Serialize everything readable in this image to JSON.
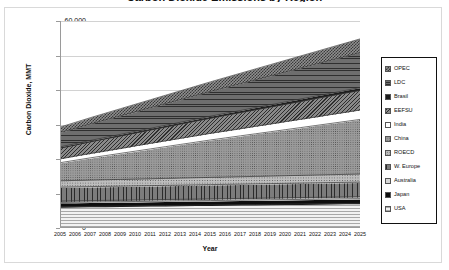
{
  "chart_data": {
    "type": "area",
    "stacked": true,
    "title": "Carbon Dioxide Emissions by Region",
    "xlabel": "Year",
    "ylabel": "Carbon Dioxide, MMT",
    "ylim": [
      0,
      60000
    ],
    "yticks": [
      "0",
      "10,000",
      "20,000",
      "30,000",
      "40,000",
      "50,000",
      "60,000"
    ],
    "ytick_values": [
      0,
      10000,
      20000,
      30000,
      40000,
      50000,
      60000
    ],
    "grid": true,
    "legend_position": "right",
    "categories": [
      "2005",
      "2006",
      "2007",
      "2008",
      "2009",
      "2010",
      "2011",
      "2012",
      "2013",
      "2014",
      "2015",
      "2016",
      "2017",
      "2018",
      "2019",
      "2020",
      "2021",
      "2022",
      "2023",
      "2024",
      "2025"
    ],
    "series": [
      {
        "name": "USA",
        "swatch": "usa-swatch",
        "values": [
          5900,
          5950,
          6000,
          6050,
          6100,
          6150,
          6200,
          6250,
          6300,
          6350,
          6400,
          6450,
          6500,
          6550,
          6600,
          6650,
          6700,
          6750,
          6800,
          6850,
          6900
        ]
      },
      {
        "name": "Japan",
        "swatch": "japan-swatch",
        "values": [
          1250,
          1255,
          1260,
          1265,
          1270,
          1275,
          1280,
          1285,
          1290,
          1295,
          1300,
          1305,
          1310,
          1315,
          1320,
          1325,
          1330,
          1335,
          1340,
          1345,
          1350
        ]
      },
      {
        "name": "Australia",
        "swatch": "australia-swatch",
        "values": [
          420,
          428,
          436,
          444,
          452,
          460,
          468,
          476,
          484,
          492,
          500,
          508,
          516,
          524,
          532,
          540,
          548,
          556,
          564,
          572,
          580
        ]
      },
      {
        "name": "W. Europe",
        "swatch": "w-europe-swatch",
        "values": [
          4050,
          4060,
          4070,
          4080,
          4090,
          4100,
          4110,
          4120,
          4130,
          4140,
          4150,
          4160,
          4170,
          4180,
          4190,
          4200,
          4210,
          4220,
          4230,
          4240,
          4250
        ]
      },
      {
        "name": "ROECD",
        "swatch": "roecd-swatch",
        "values": [
          1850,
          1875,
          1900,
          1925,
          1950,
          1975,
          2000,
          2025,
          2050,
          2075,
          2100,
          2125,
          2150,
          2175,
          2200,
          2225,
          2250,
          2275,
          2300,
          2325,
          2350
        ]
      },
      {
        "name": "China",
        "swatch": "china-swatch",
        "values": [
          5300,
          5900,
          6500,
          7050,
          7600,
          8150,
          8700,
          9250,
          9800,
          10350,
          10900,
          11400,
          11900,
          12400,
          12900,
          13400,
          13900,
          14400,
          14900,
          15400,
          15900
        ]
      },
      {
        "name": "India",
        "swatch": "india-swatch",
        "values": [
          1150,
          1230,
          1310,
          1390,
          1470,
          1550,
          1630,
          1710,
          1790,
          1870,
          1950,
          2030,
          2110,
          2190,
          2270,
          2350,
          2430,
          2510,
          2590,
          2670,
          2750
        ]
      },
      {
        "name": "EEFSU",
        "swatch": "eefsu-swatch",
        "values": [
          3100,
          3230,
          3360,
          3490,
          3620,
          3750,
          3880,
          4010,
          4140,
          4270,
          4400,
          4530,
          4660,
          4790,
          4920,
          5050,
          5180,
          5310,
          5440,
          5570,
          5700
        ]
      },
      {
        "name": "Brasil",
        "swatch": "brasil-swatch",
        "values": [
          360,
          382,
          404,
          426,
          448,
          470,
          492,
          514,
          536,
          558,
          580,
          602,
          624,
          646,
          668,
          690,
          712,
          734,
          756,
          778,
          800
        ]
      },
      {
        "name": "LDC",
        "swatch": "ldc-swatch",
        "values": [
          4200,
          4500,
          4800,
          5100,
          5400,
          5700,
          6000,
          6300,
          6600,
          6900,
          7200,
          7500,
          7800,
          8100,
          8400,
          8700,
          9000,
          9300,
          9600,
          9900,
          10200
        ]
      },
      {
        "name": "OPEC",
        "swatch": "opec-swatch",
        "values": [
          1600,
          1720,
          1840,
          1960,
          2080,
          2200,
          2320,
          2440,
          2560,
          2680,
          2800,
          2920,
          3040,
          3160,
          3280,
          3400,
          3520,
          3640,
          3760,
          3880,
          4000
        ]
      }
    ],
    "stack_totals": [
      29180,
      30605,
      32080,
      33505,
      34980,
      36455,
      37880,
      39355,
      40830,
      42255,
      43730,
      45155,
      46580,
      48005,
      49430,
      50805,
      52230,
      53605,
      55030,
      56405,
      57780
    ]
  },
  "legend": {
    "items": [
      {
        "label": "OPEC",
        "key": "opec"
      },
      {
        "label": "LDC",
        "key": "ldc"
      },
      {
        "label": "Brasil",
        "key": "brasil"
      },
      {
        "label": "EEFSU",
        "key": "eefsu"
      },
      {
        "label": "India",
        "key": "india"
      },
      {
        "label": "China",
        "key": "china"
      },
      {
        "label": "ROECD",
        "key": "roecd"
      },
      {
        "label": "W. Europe",
        "key": "w-europe"
      },
      {
        "label": "Australia",
        "key": "australia"
      },
      {
        "label": "Japan",
        "key": "japan"
      },
      {
        "label": "USA",
        "key": "usa"
      }
    ]
  }
}
